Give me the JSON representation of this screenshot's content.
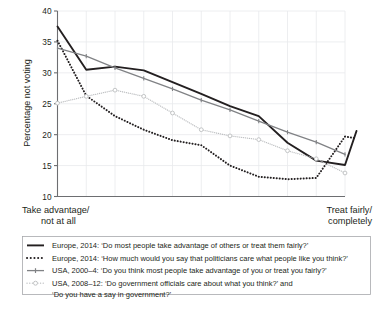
{
  "chart_data": {
    "type": "line",
    "title": "",
    "xlabel": "",
    "ylabel": "Percentage not voting",
    "ylim": [
      10,
      40
    ],
    "xlim": [
      0,
      10
    ],
    "yticks": [
      "10",
      "15",
      "20",
      "25",
      "30",
      "35",
      "40"
    ],
    "ytick_values": [
      10,
      15,
      20,
      25,
      30,
      35,
      40
    ],
    "grid": true,
    "grid_orientation": "both",
    "legend_position": "below-plot",
    "x_axis_left_label_line1": "Take advantage/",
    "x_axis_left_label_line2": "not at all",
    "x_axis_right_label_line1": "Treat fairly/",
    "x_axis_right_label_line2": "completely",
    "colors": {
      "series_1": "#231f20",
      "series_2": "#231f20",
      "series_3": "#808285",
      "series_4": "#bcbec0",
      "grid": "#e9eaec",
      "axis": "#6d6e71",
      "legend_border": "#a7a9ac",
      "background": "#ffffff"
    },
    "series": [
      {
        "name": "Europe, 2014: 'Do most people take advantage of others or treat them fairly?'",
        "style": "solid",
        "color": "#231f20",
        "width": 1.9,
        "marker": "none",
        "x": [
          0,
          1,
          2,
          3,
          4,
          5,
          6,
          7,
          8,
          9,
          10
        ],
        "values": [
          37.5,
          30.5,
          31.0,
          30.4,
          28.5,
          26.6,
          24.6,
          23.0,
          18.7,
          15.8,
          15.1
        ],
        "x_extra": [
          10.4
        ],
        "values_extra": [
          20.6
        ]
      },
      {
        "name": "Europe, 2014: 'How much would you say that politicians care what people like you think?'",
        "style": "dotted",
        "color": "#231f20",
        "width": 2.0,
        "marker": "none",
        "x": [
          0,
          1,
          2,
          3,
          4,
          5,
          6,
          7,
          8,
          9,
          10
        ],
        "values": [
          35.2,
          26.3,
          23.0,
          20.8,
          19.1,
          18.3,
          15.0,
          13.2,
          12.8,
          13.0,
          19.7
        ],
        "x_extra": [
          10.4
        ],
        "values_extra": [
          19.4
        ]
      },
      {
        "name": "USA, 2000–4: 'Do you think most people take advantage of you or treat you fairly?'",
        "style": "solid",
        "color": "#808285",
        "width": 1.3,
        "marker": "tick",
        "x": [
          0,
          1,
          2,
          3,
          4,
          5,
          6,
          7,
          8,
          9,
          10
        ],
        "values": [
          34.0,
          32.7,
          30.8,
          29.1,
          27.4,
          25.6,
          24.0,
          22.2,
          20.4,
          18.8,
          16.8
        ]
      },
      {
        "name": "USA, 2008–12: 'Do government officials care about what you think?' and 'Do you have a say in government?'",
        "style": "dotted",
        "color": "#bcbec0",
        "width": 1.3,
        "marker": "circle",
        "x": [
          0,
          1,
          2,
          3,
          4,
          5,
          6,
          7,
          8,
          9,
          10
        ],
        "values": [
          25.1,
          26.2,
          27.2,
          26.2,
          23.5,
          20.8,
          19.8,
          19.2,
          17.4,
          16.1,
          13.8
        ]
      }
    ]
  },
  "legend": {
    "entries": [
      {
        "marker": "solid-black-line",
        "text": "Europe, 2014: ‘Do most people take advantage of others or treat them fairly?’"
      },
      {
        "marker": "dotted-black-line",
        "text": "Europe, 2014: ‘How much would you say that politicians care what people like you think?’"
      },
      {
        "marker": "gray-line-with-tick-marker",
        "text": "USA, 2000–4: ‘Do you think most people take advantage of you or treat you fairly?’"
      },
      {
        "marker": "light-gray-dotted-line-with-circle-marker",
        "text": "USA, 2008–12: ‘Do government officials care about what you think?’ and",
        "text_line2": "‘Do you have a say in government?’"
      }
    ]
  }
}
